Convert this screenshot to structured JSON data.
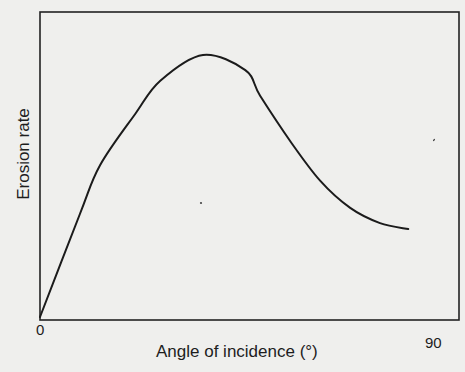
{
  "chart_data": {
    "type": "line",
    "title": "",
    "xlabel": "Angle of incidence (°)",
    "ylabel": "Erosion rate",
    "xlim": [
      0,
      90
    ],
    "ylim": [
      0,
      100
    ],
    "x_ticks": [
      "0",
      "90"
    ],
    "y_ticks": [],
    "grid": false,
    "legend": null,
    "frame": "box",
    "series": [
      {
        "name": "Erosion rate",
        "units": "relative (no y scale shown)",
        "x": [
          0,
          8.6,
          12.9,
          20.5,
          25.9,
          35.1,
          44.2,
          47.4,
          53.9,
          60.3,
          66.8,
          73.2,
          79.3
        ],
        "y": [
          0,
          34,
          50,
          67,
          78,
          86.5,
          81.5,
          73,
          58,
          45,
          36,
          31,
          29
        ]
      }
    ],
    "annotations": {
      "peak": {
        "x": 35,
        "y": 86.5
      }
    }
  },
  "labels": {
    "x_axis_title": "Angle of incidence (°)",
    "y_axis_title": "Erosion rate",
    "x_tick_min": "0",
    "x_tick_max": "90"
  },
  "colors": {
    "background": "#efefed",
    "ink": "#1b1b1b"
  }
}
